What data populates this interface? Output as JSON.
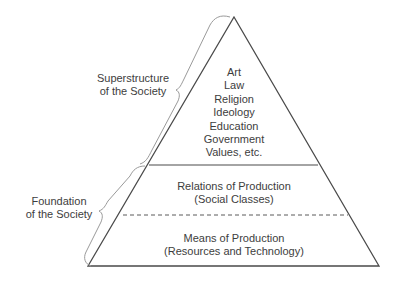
{
  "diagram": {
    "type": "pyramid",
    "colors": {
      "outline": "#4a4a4a",
      "brace": "#9a9a9a",
      "text": "#3d3d3d"
    },
    "superstructure_label": {
      "line1": "Superstructure",
      "line2": "of the Society"
    },
    "foundation_label": {
      "line1": "Foundation",
      "line2": "of the Society"
    },
    "tiers": {
      "top": {
        "items": [
          "Art",
          "Law",
          "Religion",
          "Ideology",
          "Education",
          "Government",
          "Values, etc."
        ]
      },
      "middle": {
        "line1": "Relations of Production",
        "line2": "(Social Classes)"
      },
      "bottom": {
        "line1": "Means of Production",
        "line2": "(Resources and Technology)"
      }
    }
  }
}
